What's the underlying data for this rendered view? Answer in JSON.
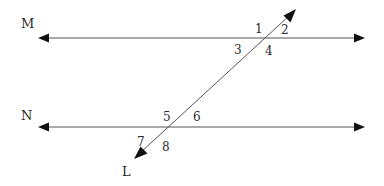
{
  "diagram": {
    "type": "parallel-lines-cut-by-transversal",
    "colors": {
      "line": "#555555",
      "arrow": "#111111",
      "text": "#2a2a2a",
      "background": "#ffffff"
    },
    "lines": [
      {
        "id": "M",
        "label": "M",
        "kind": "horizontal",
        "y": 38,
        "x1": 38,
        "x2": 365
      },
      {
        "id": "N",
        "label": "N",
        "kind": "horizontal",
        "y": 127,
        "x1": 38,
        "x2": 365
      },
      {
        "id": "L",
        "label": "L",
        "kind": "transversal",
        "x1": 296,
        "y1": 9,
        "x2": 134,
        "y2": 159
      }
    ],
    "line_labels": {
      "M": "M",
      "N": "N",
      "L": "L"
    },
    "angles": [
      {
        "label": "1",
        "at": "M",
        "position": "upper-left"
      },
      {
        "label": "2",
        "at": "M",
        "position": "upper-right"
      },
      {
        "label": "3",
        "at": "M",
        "position": "lower-left"
      },
      {
        "label": "4",
        "at": "M",
        "position": "lower-right"
      },
      {
        "label": "5",
        "at": "N",
        "position": "upper-left"
      },
      {
        "label": "6",
        "at": "N",
        "position": "upper-right"
      },
      {
        "label": "7",
        "at": "N",
        "position": "lower-left"
      },
      {
        "label": "8",
        "at": "N",
        "position": "lower-right"
      }
    ]
  }
}
